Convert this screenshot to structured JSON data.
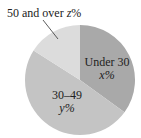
{
  "chart_data": {
    "type": "pie",
    "title": "",
    "slices": [
      {
        "label": "Under 30",
        "value_label": "x%",
        "value_var": "x",
        "approx_percent": 35,
        "color": "#a9a9a9"
      },
      {
        "label": "30–49",
        "value_label": "y%",
        "value_var": "y",
        "approx_percent": 49,
        "color": "#c4c4c4"
      },
      {
        "label": "50 and over",
        "value_label": "z%",
        "value_var": "z",
        "approx_percent": 16,
        "color": "#dcdcdc"
      }
    ],
    "start_angle_deg": 0,
    "direction": "clockwise",
    "legend": "none",
    "labels_position": "inside, except '50 and over' outside with leader line"
  },
  "labels": {
    "under30_line1": "Under 30",
    "under30_line2": "x%",
    "mid_line1": "30–49",
    "mid_line2": "y%",
    "over50_prefix": "50 and over ",
    "over50_var": "z",
    "over50_suffix": "%"
  }
}
